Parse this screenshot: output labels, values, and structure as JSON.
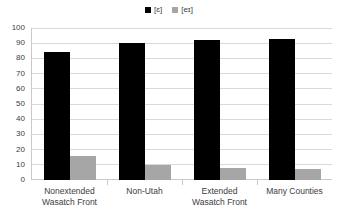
{
  "chart_data": {
    "type": "bar",
    "title": "",
    "subtitle": "",
    "xlabel": "",
    "ylabel": "",
    "ylim": [
      0,
      100
    ],
    "ytick_step": 10,
    "yticks": [
      "100",
      "90",
      "80",
      "70",
      "60",
      "50",
      "40",
      "30",
      "20",
      "10",
      "0"
    ],
    "grid": true,
    "legend_position": "top-center",
    "categories": [
      "Nonextended Wasatch Front",
      "Non-Utah",
      "Extended Wasatch Front",
      "Many Counties"
    ],
    "category_lines": [
      [
        "Nonextended",
        "Wasatch Front"
      ],
      [
        "Non-Utah",
        ""
      ],
      [
        "Extended",
        "Wasatch Front"
      ],
      [
        "Many Counties",
        ""
      ]
    ],
    "series": [
      {
        "name": "[ɛ]",
        "color": "#000000",
        "values": [
          84,
          90,
          92,
          93
        ]
      },
      {
        "name": "[eɪ]",
        "color": "#a6a6a6",
        "values": [
          16,
          10,
          8,
          7
        ]
      }
    ]
  },
  "legend": {
    "entries": [
      {
        "label": "[ɛ]",
        "swatch": "legend-swatch-black"
      },
      {
        "label": "[eɪ]",
        "swatch": "legend-swatch-gray"
      }
    ]
  },
  "colors": {
    "series_epsilon": "#000000",
    "series_ei": "#a6a6a6",
    "gridline": "#d9d9d9",
    "axis": "#c9c9c9",
    "text": "#3d3d3d",
    "background": "#ffffff"
  }
}
